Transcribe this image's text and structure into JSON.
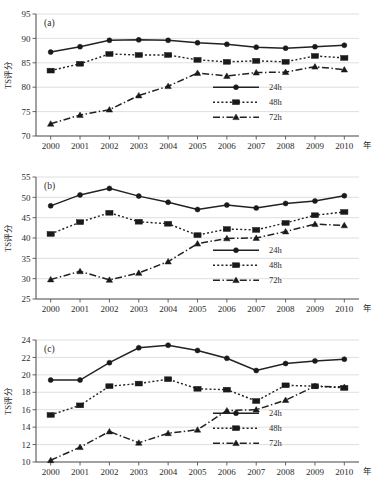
{
  "figure": {
    "background": "#ffffff",
    "ink": "#222222",
    "grid_color": "#c9c9c9"
  },
  "common": {
    "ylabel": "TS评分",
    "xunit": "年",
    "categories": [
      "2000",
      "2001",
      "2002",
      "2003",
      "2004",
      "2005",
      "2006",
      "2007",
      "2008",
      "2009",
      "2010"
    ],
    "legend": [
      {
        "label": "24h",
        "marker": "circle",
        "style": "solid"
      },
      {
        "label": "48h",
        "marker": "square",
        "style": "dotted"
      },
      {
        "label": "72h",
        "marker": "triangle",
        "style": "dash-dot"
      }
    ]
  },
  "chart_data": [
    {
      "type": "line",
      "panel": "(a)",
      "title": "",
      "xlabel": "年",
      "ylabel": "TS评分",
      "x": [
        "2000",
        "2001",
        "2002",
        "2003",
        "2004",
        "2005",
        "2006",
        "2007",
        "2008",
        "2009",
        "2010"
      ],
      "categories": [
        "2000",
        "2001",
        "2002",
        "2003",
        "2004",
        "2005",
        "2006",
        "2007",
        "2008",
        "2009",
        "2010"
      ],
      "ylim": [
        70,
        95
      ],
      "yticks": [
        70,
        75,
        80,
        85,
        90,
        95
      ],
      "grid": true,
      "legend_position": "center-right",
      "series": [
        {
          "name": "24h",
          "marker": "circle",
          "style": "solid",
          "values": [
            87.2,
            88.3,
            89.6,
            89.7,
            89.6,
            89.1,
            88.8,
            88.2,
            88.0,
            88.3,
            88.6
          ]
        },
        {
          "name": "48h",
          "marker": "square",
          "style": "dotted",
          "values": [
            83.4,
            84.8,
            86.8,
            86.6,
            86.6,
            85.6,
            85.2,
            85.4,
            85.2,
            86.4,
            86.0
          ]
        },
        {
          "name": "72h",
          "marker": "triangle",
          "style": "dash-dot",
          "values": [
            72.5,
            74.3,
            75.4,
            78.3,
            80.2,
            82.9,
            82.3,
            83.0,
            83.1,
            84.2,
            83.6
          ]
        }
      ]
    },
    {
      "type": "line",
      "panel": "(b)",
      "title": "",
      "xlabel": "年",
      "ylabel": "TS评分",
      "x": [
        "2000",
        "2001",
        "2002",
        "2003",
        "2004",
        "2005",
        "2006",
        "2007",
        "2008",
        "2009",
        "2010"
      ],
      "categories": [
        "2000",
        "2001",
        "2002",
        "2003",
        "2004",
        "2005",
        "2006",
        "2007",
        "2008",
        "2009",
        "2010"
      ],
      "ylim": [
        25,
        55
      ],
      "yticks": [
        25,
        30,
        35,
        40,
        45,
        50,
        55
      ],
      "grid": true,
      "legend_position": "center-right",
      "series": [
        {
          "name": "24h",
          "marker": "circle",
          "style": "solid",
          "values": [
            47.9,
            50.6,
            52.2,
            50.3,
            48.8,
            47.0,
            48.1,
            47.4,
            48.5,
            49.1,
            50.4
          ]
        },
        {
          "name": "48h",
          "marker": "square",
          "style": "dotted",
          "values": [
            41.0,
            43.9,
            46.2,
            44.0,
            43.5,
            40.7,
            42.2,
            42.0,
            43.7,
            45.6,
            46.4
          ]
        },
        {
          "name": "72h",
          "marker": "triangle",
          "style": "dash-dot",
          "values": [
            29.8,
            31.8,
            29.7,
            31.4,
            34.2,
            38.6,
            39.9,
            40.0,
            41.6,
            43.4,
            43.1
          ]
        }
      ]
    },
    {
      "type": "line",
      "panel": "(c)",
      "title": "",
      "xlabel": "年",
      "ylabel": "TS评分",
      "x": [
        "2000",
        "2001",
        "2002",
        "2003",
        "2004",
        "2005",
        "2006",
        "2007",
        "2008",
        "2009",
        "2010"
      ],
      "categories": [
        "2000",
        "2001",
        "2002",
        "2003",
        "2004",
        "2005",
        "2006",
        "2007",
        "2008",
        "2009",
        "2010"
      ],
      "ylim": [
        10,
        24
      ],
      "yticks": [
        10,
        12,
        14,
        16,
        18,
        20,
        22,
        24
      ],
      "grid": true,
      "legend_position": "center-right",
      "series": [
        {
          "name": "24h",
          "marker": "circle",
          "style": "solid",
          "values": [
            19.4,
            19.4,
            21.4,
            23.1,
            23.4,
            22.8,
            21.9,
            20.5,
            21.3,
            21.6,
            21.8
          ]
        },
        {
          "name": "48h",
          "marker": "square",
          "style": "dotted",
          "values": [
            15.4,
            16.5,
            18.7,
            19.0,
            19.5,
            18.4,
            18.3,
            17.0,
            18.8,
            18.7,
            18.5
          ]
        },
        {
          "name": "72h",
          "marker": "triangle",
          "style": "dash-dot",
          "values": [
            10.2,
            11.7,
            13.5,
            12.2,
            13.3,
            13.7,
            15.9,
            16.0,
            17.1,
            18.7,
            18.6
          ]
        }
      ]
    }
  ]
}
